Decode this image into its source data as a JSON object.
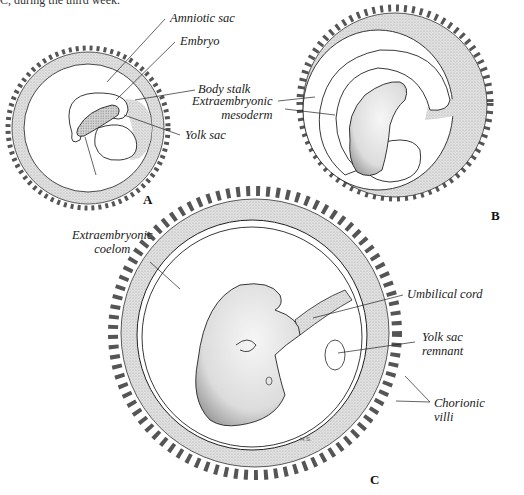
{
  "caption_fragment": "C, during the third week.",
  "panels": {
    "A": {
      "letter": "A",
      "labels": {
        "amniotic_sac": "Amniotic sac",
        "embryo": "Embryo",
        "body_stalk": "Body stalk",
        "yolk_sac": "Yolk sac",
        "extraembryonic_coelom_line1": "Extraembryonic",
        "extraembryonic_coelom_line2": "coelom"
      }
    },
    "B": {
      "letter": "B",
      "labels": {
        "extraembryonic_mesoderm_line1": "Extraembryonic",
        "extraembryonic_mesoderm_line2": "mesoderm"
      }
    },
    "C": {
      "letter": "C",
      "signature": "H.S.",
      "labels": {
        "umbilical_cord": "Umbilical cord",
        "yolk_sac_remnant_line1": "Yolk sac",
        "yolk_sac_remnant_line2": "remnant",
        "chorionic_villi_line1": "Chorionic",
        "chorionic_villi_line2": "villi"
      }
    }
  },
  "colors": {
    "stipple": "#d4d4d4",
    "line": "#222222",
    "background": "#ffffff"
  }
}
